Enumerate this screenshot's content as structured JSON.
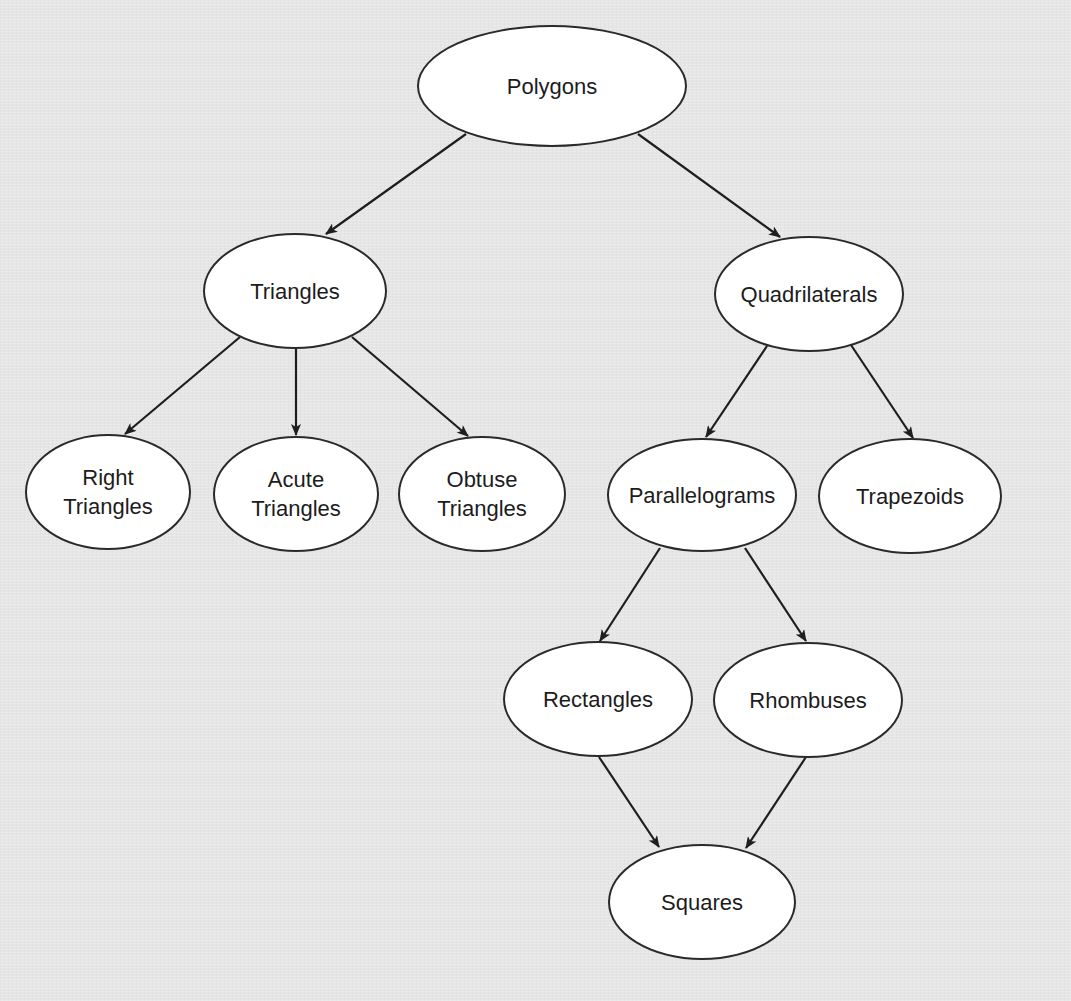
{
  "diagram": {
    "type": "hierarchy-tree",
    "background_color": "#e6e6e6",
    "node_fill": "#ffffff",
    "stroke_color": "#2a2a2a",
    "text_color": "#1c1c1c",
    "nodes": {
      "polygons": {
        "label": "Polygons",
        "cx": 552,
        "cy": 86,
        "rx": 135,
        "ry": 61
      },
      "triangles": {
        "label": "Triangles",
        "cx": 295,
        "cy": 291,
        "rx": 92,
        "ry": 58
      },
      "quadrilaterals": {
        "label": "Quadrilaterals",
        "cx": 809,
        "cy": 294,
        "rx": 95,
        "ry": 58
      },
      "right_triangles": {
        "label": "Right\nTriangles",
        "cx": 108,
        "cy": 492,
        "rx": 83,
        "ry": 58
      },
      "acute_triangles": {
        "label": "Acute\nTriangles",
        "cx": 296,
        "cy": 494,
        "rx": 83,
        "ry": 58
      },
      "obtuse_triangles": {
        "label": "Obtuse\nTriangles",
        "cx": 482,
        "cy": 494,
        "rx": 84,
        "ry": 58
      },
      "parallelograms": {
        "label": "Parallelograms",
        "cx": 702,
        "cy": 495,
        "rx": 95,
        "ry": 57
      },
      "trapezoids": {
        "label": "Trapezoids",
        "cx": 910,
        "cy": 496,
        "rx": 92,
        "ry": 58
      },
      "rectangles": {
        "label": "Rectangles",
        "cx": 598,
        "cy": 699,
        "rx": 95,
        "ry": 58
      },
      "rhombuses": {
        "label": "Rhombuses",
        "cx": 808,
        "cy": 700,
        "rx": 95,
        "ry": 58
      },
      "squares": {
        "label": "Squares",
        "cx": 702,
        "cy": 902,
        "rx": 94,
        "ry": 58
      }
    },
    "edges": [
      {
        "from": "Polygons",
        "to": "Triangles",
        "x1": 466,
        "y1": 134,
        "x2": 326,
        "y2": 234
      },
      {
        "from": "Polygons",
        "to": "Quadrilaterals",
        "x1": 638,
        "y1": 134,
        "x2": 780,
        "y2": 237
      },
      {
        "from": "Triangles",
        "to": "Right Triangles",
        "x1": 240,
        "y1": 337,
        "x2": 125,
        "y2": 434
      },
      {
        "from": "Triangles",
        "to": "Acute Triangles",
        "x1": 296,
        "y1": 349,
        "x2": 296,
        "y2": 435
      },
      {
        "from": "Triangles",
        "to": "Obtuse Triangles",
        "x1": 352,
        "y1": 337,
        "x2": 468,
        "y2": 436
      },
      {
        "from": "Quadrilaterals",
        "to": "Parallelograms",
        "x1": 767,
        "y1": 346,
        "x2": 706,
        "y2": 437
      },
      {
        "from": "Quadrilaterals",
        "to": "Trapezoids",
        "x1": 851,
        "y1": 345,
        "x2": 913,
        "y2": 438
      },
      {
        "from": "Parallelograms",
        "to": "Rectangles",
        "x1": 660,
        "y1": 548,
        "x2": 600,
        "y2": 641
      },
      {
        "from": "Parallelograms",
        "to": "Rhombuses",
        "x1": 745,
        "y1": 548,
        "x2": 806,
        "y2": 641
      },
      {
        "from": "Rectangles",
        "to": "Squares",
        "x1": 599,
        "y1": 757,
        "x2": 659,
        "y2": 847
      },
      {
        "from": "Rhombuses",
        "to": "Squares",
        "x1": 806,
        "y1": 757,
        "x2": 746,
        "y2": 848
      }
    ]
  }
}
